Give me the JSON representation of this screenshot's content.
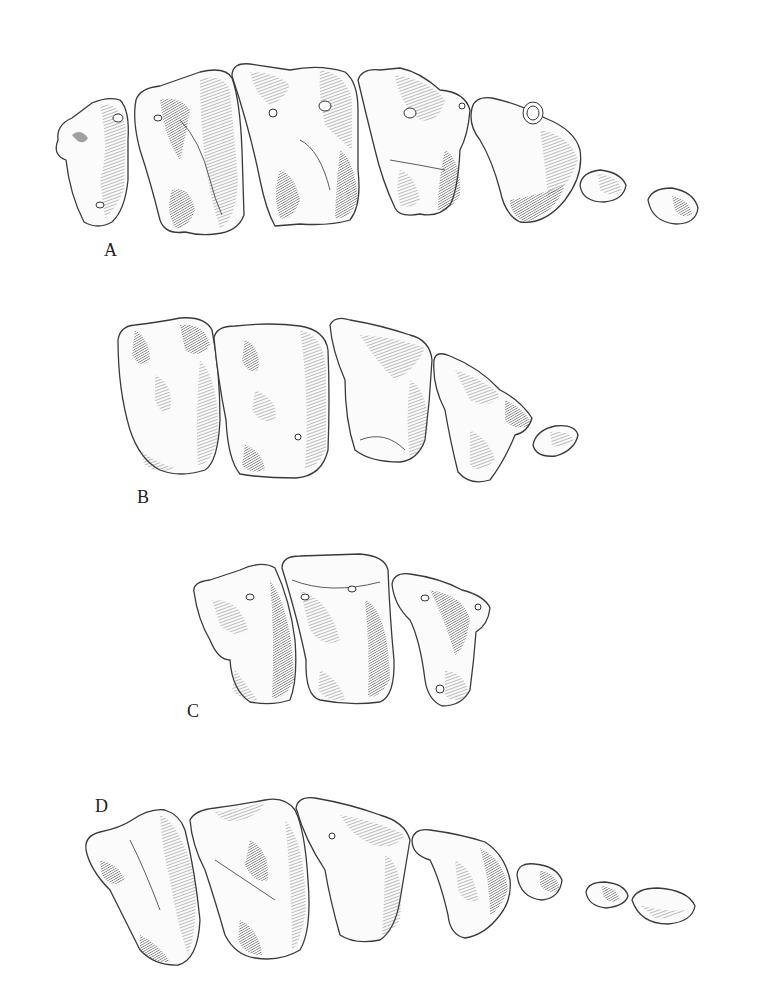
{
  "figure": {
    "background_color": "#ffffff",
    "ink_color": "#3a3a3a",
    "panels": [
      {
        "id": "A",
        "label": "A",
        "tooth_count": 7
      },
      {
        "id": "B",
        "label": "B",
        "tooth_count": 5
      },
      {
        "id": "C",
        "label": "C",
        "tooth_count": 3
      },
      {
        "id": "D",
        "label": "D",
        "tooth_count": 7
      }
    ]
  }
}
